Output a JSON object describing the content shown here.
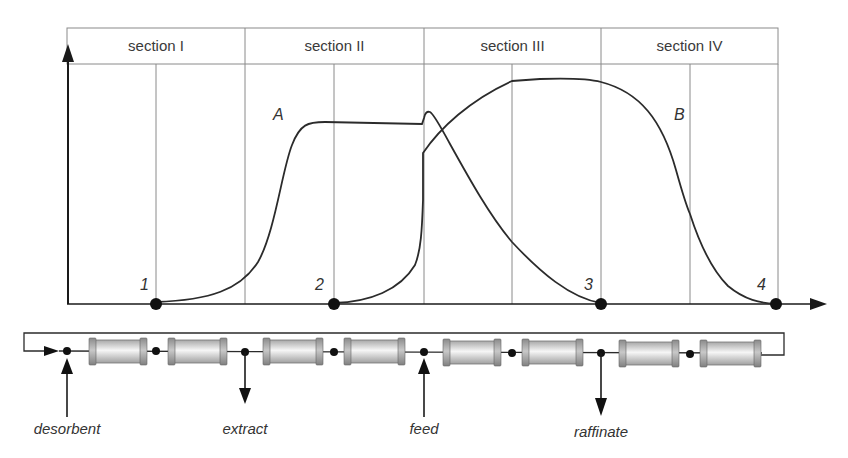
{
  "sections": [
    {
      "label": "section I",
      "x0": 67,
      "x1": 245
    },
    {
      "label": "section II",
      "x0": 245,
      "x1": 424
    },
    {
      "label": "section III",
      "x0": 424,
      "x1": 601
    },
    {
      "label": "section IV",
      "x0": 601,
      "x1": 778
    }
  ],
  "curves": {
    "A": {
      "label": "A",
      "x": 273,
      "y": 106
    },
    "B": {
      "label": "B",
      "x": 674,
      "y": 106
    }
  },
  "points": [
    {
      "label": "1",
      "x": 156,
      "y": 304
    },
    {
      "label": "2",
      "x": 334,
      "y": 304
    },
    {
      "label": "3",
      "x": 601,
      "y": 304
    },
    {
      "label": "4",
      "x": 776,
      "y": 304
    }
  ],
  "ports": [
    {
      "label": "desorbent",
      "x": 67,
      "direction": "in"
    },
    {
      "label": "extract",
      "x": 245,
      "direction": "out"
    },
    {
      "label": "feed",
      "x": 424,
      "direction": "in"
    },
    {
      "label": "raffinate",
      "x": 601,
      "direction": "out"
    }
  ],
  "columns": [
    {
      "x0": 90,
      "x1": 146
    },
    {
      "x0": 169,
      "x1": 226
    },
    {
      "x0": 264,
      "x1": 322
    },
    {
      "x0": 345,
      "x1": 404
    },
    {
      "x0": 444,
      "x1": 500
    },
    {
      "x0": 523,
      "x1": 582
    },
    {
      "x0": 620,
      "x1": 678
    },
    {
      "x0": 701,
      "x1": 760
    }
  ],
  "colors": {
    "line": "#2b2b2b",
    "grid": "#8a8a8a",
    "column_cap": "#9a9a9a",
    "column_body_light": "#f6f6f6",
    "column_body_dark": "#b8b8b8"
  }
}
